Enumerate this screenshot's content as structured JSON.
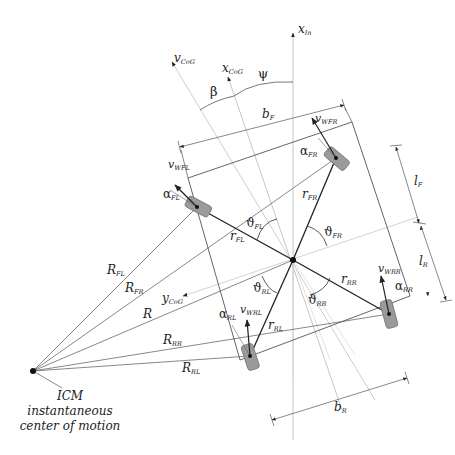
{
  "diagram": {
    "axes": {
      "x_in": {
        "main": "x",
        "sub": "In"
      },
      "x_cog": {
        "main": "x",
        "sub": "CoG"
      },
      "v_cog": {
        "main": "v",
        "sub": "CoG"
      },
      "y_cog": {
        "main": "y",
        "sub": "CoG"
      }
    },
    "angles": {
      "psi": "ψ",
      "beta": "β",
      "theta_fl": {
        "main": "ϑ",
        "sub": "FL"
      },
      "theta_fr": {
        "main": "ϑ",
        "sub": "FR"
      },
      "theta_rl": {
        "main": "ϑ",
        "sub": "RL"
      },
      "theta_rr": {
        "main": "ϑ",
        "sub": "RR"
      },
      "alpha_fl": {
        "main": "α",
        "sub": "FL"
      },
      "alpha_fr": {
        "main": "α",
        "sub": "FR"
      },
      "alpha_rl": {
        "main": "α",
        "sub": "RL"
      },
      "alpha_rr": {
        "main": "α",
        "sub": "RR"
      }
    },
    "wheel_velocities": {
      "fl": {
        "main": "v",
        "sub": "WFL"
      },
      "fr": {
        "main": "v",
        "sub": "WFR"
      },
      "rl": {
        "main": "v",
        "sub": "WRL"
      },
      "rr": {
        "main": "v",
        "sub": "WRR"
      }
    },
    "dimensions": {
      "b_f": {
        "main": "b",
        "sub": "F"
      },
      "b_r": {
        "main": "b",
        "sub": "R"
      },
      "l_f": {
        "main": "l",
        "sub": "F"
      },
      "l_r": {
        "main": "l",
        "sub": "R"
      }
    },
    "cog_radii": {
      "r_fl": {
        "main": "r",
        "sub": "FL"
      },
      "r_fr": {
        "main": "r",
        "sub": "FR"
      },
      "r_rl": {
        "main": "r",
        "sub": "RL"
      },
      "r_rr": {
        "main": "r",
        "sub": "RR"
      }
    },
    "icm_radii": {
      "R_fl": {
        "main": "R",
        "sub": "FL"
      },
      "R_fr": {
        "main": "R",
        "sub": "FR"
      },
      "R": {
        "main": "R",
        "sub": ""
      },
      "R_rr": {
        "main": "R",
        "sub": "RR"
      },
      "R_rl": {
        "main": "R",
        "sub": "RL"
      }
    },
    "icm": {
      "label": "ICM",
      "line1": "instantaneous",
      "line2": "center of motion"
    },
    "colors": {
      "ink": "#222222",
      "thin_line": "#555555",
      "light_line": "#b8b8b8",
      "wheel_fill": "#9a9a9a",
      "wheel_stroke": "#6e6e6e"
    }
  }
}
